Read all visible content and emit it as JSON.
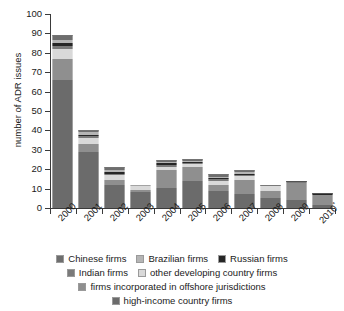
{
  "chart_data": {
    "type": "bar",
    "subtype": "stacked-bar",
    "title": "",
    "xlabel": "",
    "ylabel": "number of ADR issues",
    "ylim": [
      0,
      100
    ],
    "yticks": [
      0,
      10,
      20,
      30,
      40,
      50,
      60,
      70,
      80,
      90,
      100
    ],
    "grid": false,
    "legend_position": "bottom",
    "categories": [
      "2000",
      "2001",
      "2002",
      "2003",
      "2004",
      "2005",
      "2006",
      "2007",
      "2008",
      "2009",
      "2010"
    ],
    "category_notes": {
      "2010": "*"
    },
    "series": [
      {
        "name": "Chinese firms",
        "color": "#6e6e6e",
        "values": [
          2.5,
          1.0,
          1.5,
          0.0,
          1.5,
          1.5,
          1.5,
          1.0,
          0.0,
          0.0,
          0.0
        ]
      },
      {
        "name": "Brazilian firms",
        "color": "#b5b5b5",
        "values": [
          1.5,
          1.5,
          1.0,
          0.0,
          0.5,
          0.5,
          0.5,
          1.0,
          0.0,
          0.0,
          0.0
        ]
      },
      {
        "name": "Russian firms",
        "color": "#262626",
        "values": [
          1.5,
          0.5,
          1.0,
          0.0,
          1.0,
          0.5,
          0.5,
          0.5,
          0.0,
          0.5,
          1.5
        ]
      },
      {
        "name": "Indian firms",
        "color": "#7a7a7a",
        "values": [
          1.5,
          1.0,
          0.5,
          0.0,
          1.0,
          0.5,
          1.0,
          0.5,
          0.5,
          0.5,
          0.0
        ]
      },
      {
        "name": "other developing country firms",
        "color": "#d9d9d9",
        "values": [
          5.0,
          3.0,
          2.5,
          2.5,
          1.5,
          1.5,
          2.0,
          2.0,
          2.5,
          0.0,
          0.0
        ]
      },
      {
        "name": "firms incorporated in offshore jurisdictions",
        "color": "#8f8f8f",
        "values": [
          11.0,
          4.0,
          2.5,
          1.5,
          9.0,
          7.0,
          3.0,
          7.5,
          4.0,
          9.0,
          5.0
        ]
      },
      {
        "name": "high-income country firms",
        "color": "#6b6b6b",
        "values": [
          66.0,
          29.0,
          12.0,
          8.0,
          10.5,
          14.0,
          9.0,
          7.0,
          5.0,
          4.0,
          1.5
        ]
      }
    ],
    "totals": [
      89,
      40,
      21,
      12,
      25,
      25,
      21.5,
      19.5,
      12,
      14,
      8
    ]
  },
  "legend": {
    "rows": [
      [
        {
          "label": "Chinese firms",
          "color": "#6e6e6e"
        },
        {
          "label": "Brazilian firms",
          "color": "#b5b5b5"
        },
        {
          "label": "Russian firms",
          "color": "#262626"
        }
      ],
      [
        {
          "label": "Indian firms",
          "color": "#7a7a7a"
        },
        {
          "label": "other developing country firms",
          "color": "#d9d9d9"
        }
      ],
      [
        {
          "label": "firms incorporated in offshore jurisdictions",
          "color": "#8f8f8f"
        }
      ],
      [
        {
          "label": "high-income country firms",
          "color": "#6b6b6b"
        }
      ]
    ]
  }
}
